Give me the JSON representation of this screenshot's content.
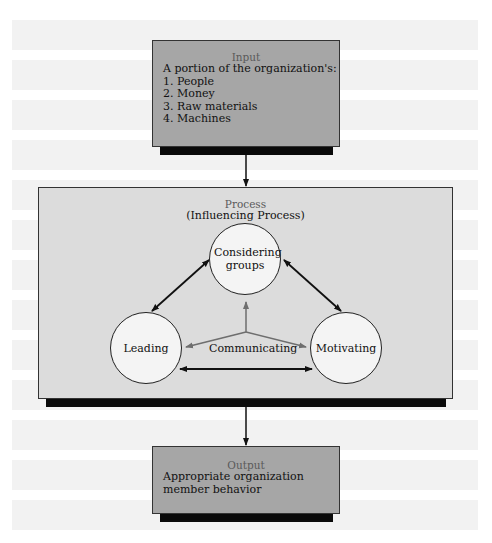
{
  "diagram": {
    "input": {
      "title": "Input",
      "intro": "A portion of the organization's:",
      "items": [
        "1. People",
        "2. Money",
        "3. Raw materials",
        "4. Machines"
      ]
    },
    "process": {
      "title": "Process",
      "subtitle": "(Influencing Process)",
      "nodes": {
        "top": "Considering groups",
        "left": "Leading",
        "right": "Motivating"
      },
      "center_label": "Communicating"
    },
    "output": {
      "title": "Output",
      "text_line1": "Appropriate organization",
      "text_line2": "member behavior"
    }
  },
  "colors": {
    "io_fill": "#a6a6a6",
    "process_fill": "#dcdcdc",
    "circle_fill": "#f4f4f4",
    "shadow": "#0a0a0a",
    "stripe": "#f2f2f2",
    "communicating_arrow": "#6e6e6e"
  }
}
